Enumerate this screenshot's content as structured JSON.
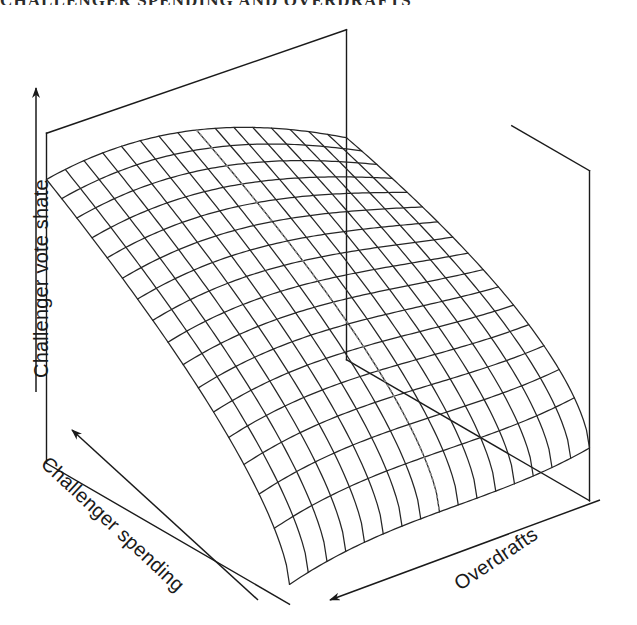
{
  "figure": {
    "cropped_heading": "CHALLENGER SPENDING AND OVERDRAFTS",
    "background_color": "#ffffff",
    "ink_color": "#1a1a1a"
  },
  "axes": {
    "vertical": {
      "label": "Challenger vote shate",
      "arrow": "up"
    },
    "left_horizontal": {
      "label": "Challenger spending",
      "arrow": "up-left"
    },
    "right_horizontal": {
      "label": "Overdrafts",
      "arrow": "down-left"
    }
  },
  "annotations": {
    "reference_line": {
      "name": "dotted-reference-line",
      "style": "dotted",
      "orientation": "vertical"
    }
  },
  "chart_data": {
    "type": "surface",
    "title": "",
    "xlabel": "Overdrafts",
    "ylabel": "Challenger spending",
    "zlabel": "Challenger vote shate",
    "grid": true,
    "legend": "none",
    "projection": {
      "yaw_deg": 42,
      "pitch_deg": 26,
      "scale_x": 300,
      "scale_y": 300,
      "scale_z": 330,
      "origin_x": 318,
      "origin_y": 482
    },
    "mesh": {
      "nx": 17,
      "ny": 17,
      "xlim": [
        0,
        1
      ],
      "ylim": [
        0,
        1
      ],
      "zlim": [
        0,
        1
      ]
    },
    "surface_model": {
      "description": "Challenger vote share rises steeply with challenger spending and is lowest at the front corner where both spending and overdrafts are at their minimum; a mild upturn appears at the high-overdraft edge.",
      "a_const": 0.06,
      "b_spending": 0.8,
      "spending_curvature": 0.62,
      "c_overdraft": 0.3,
      "overdraft_curvature": -0.46,
      "interaction": -0.1
    },
    "x": [
      0,
      0.0625,
      0.125,
      0.1875,
      0.25,
      0.3125,
      0.375,
      0.4375,
      0.5,
      0.5625,
      0.625,
      0.6875,
      0.75,
      0.8125,
      0.875,
      0.9375,
      1
    ],
    "y": [
      0,
      0.0625,
      0.125,
      0.1875,
      0.25,
      0.3125,
      0.375,
      0.4375,
      0.5,
      0.5625,
      0.625,
      0.6875,
      0.75,
      0.8125,
      0.875,
      0.9375,
      1
    ],
    "z_corners": {
      "front_low": 0.06,
      "left_back_high": 0.92,
      "right_edge": 0.47,
      "back_ridge": 0.95
    },
    "reference_line_x": 0.5
  },
  "bounding_box": {
    "visible_edges": [
      "top-back",
      "left-vertical",
      "right-vertical",
      "floor-left",
      "floor-right",
      "back-vertical"
    ]
  }
}
